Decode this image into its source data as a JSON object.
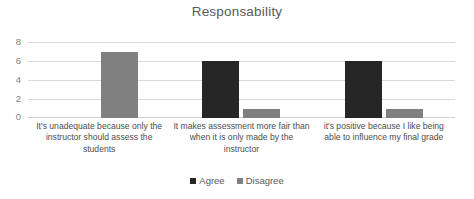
{
  "chart_data": {
    "type": "bar",
    "title": "Responsability",
    "xlabel": "",
    "ylabel": "",
    "ylim": [
      0,
      8
    ],
    "yticks": [
      0,
      2,
      4,
      6,
      8
    ],
    "grid": true,
    "legend_position": "bottom-center",
    "categories": [
      "It's unadequate because only the instructor should assess the students",
      "It makes assessment more fair than when it is only made by the instructor",
      "it's positive because I like being able to influence my final grade"
    ],
    "series": [
      {
        "name": "Agree",
        "color": "#262626",
        "values": [
          0,
          6,
          6
        ]
      },
      {
        "name": "Disagree",
        "color": "#808080",
        "values": [
          7,
          1,
          1
        ]
      }
    ]
  },
  "axis": {
    "tick_0": "0",
    "tick_2": "2",
    "tick_4": "4",
    "tick_6": "6",
    "tick_8": "8"
  },
  "legend": {
    "agree_label": "Agree",
    "disagree_label": "Disagree"
  }
}
